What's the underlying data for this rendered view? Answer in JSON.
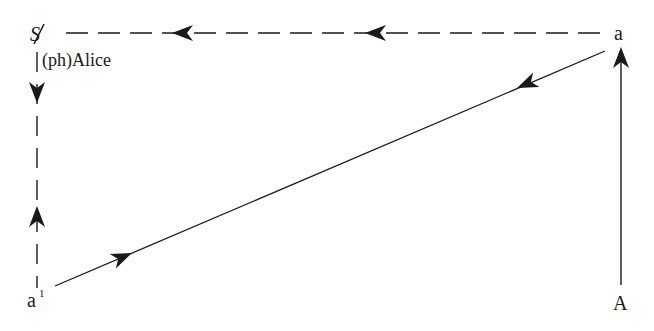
{
  "diagram": {
    "type": "schema-L",
    "nodes": {
      "top_left": {
        "symbol": "S",
        "barred": true,
        "caption": "(ph)Alice"
      },
      "top_right": {
        "label": "a"
      },
      "bottom_left": {
        "label": "a",
        "superscript": "1"
      },
      "bottom_right": {
        "label": "A"
      }
    },
    "edges": [
      {
        "id": "top",
        "from": "a",
        "to": "S (barred)",
        "style": "dashed",
        "arrowheads": 2,
        "direction": "left"
      },
      {
        "id": "left",
        "from": "S (barred)",
        "to": "a1",
        "style": "dashed",
        "arrowheads": "one down, one up",
        "direction": "both"
      },
      {
        "id": "diagonal",
        "from": "a1",
        "to": "a",
        "style": "solid",
        "arrowheads": "one toward a, one toward a1",
        "direction": "both"
      },
      {
        "id": "right",
        "from": "A",
        "to": "a",
        "style": "solid",
        "arrowheads": 1,
        "direction": "up"
      }
    ],
    "colors": {
      "ink": "#1a1a1a",
      "background": "#ffffff"
    }
  }
}
